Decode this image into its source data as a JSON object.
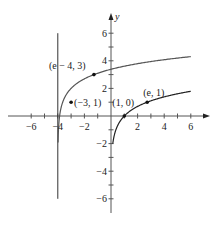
{
  "chart_data": {
    "type": "line",
    "title": "",
    "xlabel": "",
    "ylabel": "y",
    "xlim": [
      -7,
      7
    ],
    "ylim": [
      -7,
      7
    ],
    "grid": false,
    "x_ticks": [
      -6,
      -5,
      -4,
      -3,
      -2,
      -1,
      1,
      2,
      3,
      4,
      5,
      6
    ],
    "x_tick_labels": [
      {
        "value": -6,
        "label": "−6"
      },
      {
        "value": -4,
        "label": "−4"
      },
      {
        "value": -2,
        "label": "−2"
      },
      {
        "value": 2,
        "label": "2"
      },
      {
        "value": 4,
        "label": "4"
      },
      {
        "value": 6,
        "label": "6"
      }
    ],
    "y_ticks": [
      -6,
      -5,
      -4,
      -3,
      -2,
      -1,
      1,
      2,
      3,
      4,
      5,
      6
    ],
    "y_tick_labels": [
      {
        "value": 6,
        "label": "6"
      },
      {
        "value": 4,
        "label": "4"
      },
      {
        "value": 2,
        "label": "2"
      },
      {
        "value": -2,
        "label": "−2"
      },
      {
        "value": -4,
        "label": "−4"
      },
      {
        "value": -6,
        "label": "−6"
      }
    ],
    "asymptote": {
      "x": -4,
      "y_range": [
        -6,
        6
      ]
    },
    "series": [
      {
        "name": "y = ln(x + 4) + 2",
        "function": "ln(x+4)+2",
        "x_range": [
          -3.98,
          6
        ],
        "color": "#555555"
      },
      {
        "name": "y = ln x",
        "function": "ln(x)",
        "x_range": [
          0.135,
          6
        ],
        "color": "#222222"
      }
    ],
    "points": [
      {
        "x": -1.2817,
        "y": 3,
        "label": "(e − 4, 3)"
      },
      {
        "x": -3,
        "y": 1,
        "label": "(−3, 1)"
      },
      {
        "x": 1,
        "y": 0,
        "label": "(1, 0)"
      },
      {
        "x": 2.7183,
        "y": 1,
        "label": "(e, 1)"
      }
    ]
  }
}
